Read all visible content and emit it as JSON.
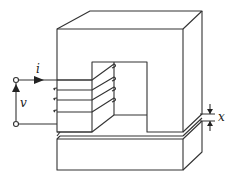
{
  "diagram": {
    "labels": {
      "current": "i",
      "voltage": "v",
      "gap": "x"
    },
    "colors": {
      "line": "#333333",
      "background": "#ffffff"
    },
    "coil_turns": 4
  }
}
